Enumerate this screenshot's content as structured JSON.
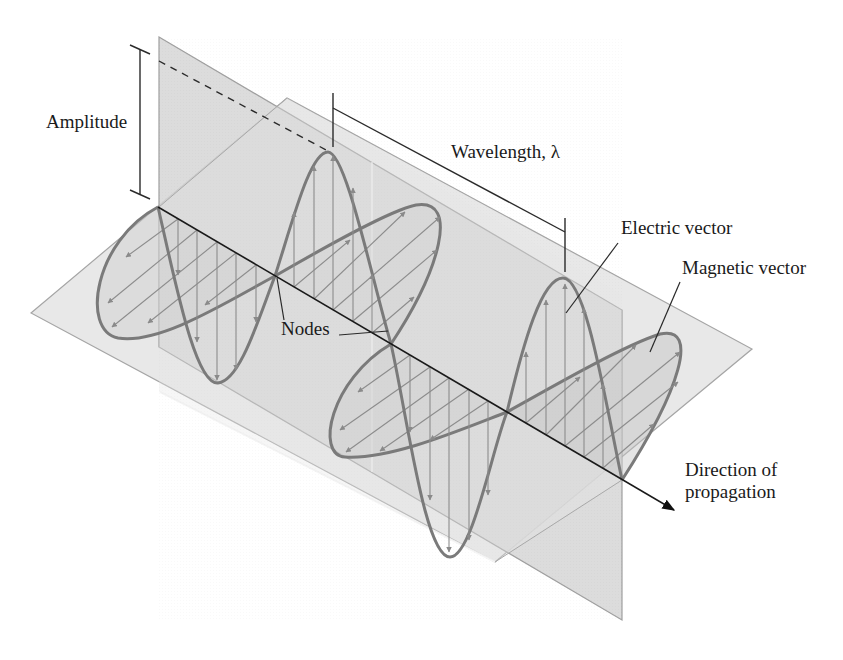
{
  "figure": {
    "labels": {
      "amplitude": "Amplitude",
      "wavelength": "Wavelength, λ",
      "electric_vector": "Electric vector",
      "magnetic_vector": "Magnetic vector",
      "nodes": "Nodes",
      "direction_line1": "Direction of",
      "direction_line2": "propagation"
    },
    "colors": {
      "background": "#ffffff",
      "vertical_plane_fill": "#d6d6d6",
      "horizontal_plane_fill": "#e6e6e6",
      "plane_edge": "#9a9a9a",
      "wave_curve": "#7a7a7a",
      "vector_arrows": "#8c8c8c",
      "axis": "#1a1a1a",
      "dimension_lines": "#2a2a2a"
    },
    "elements": [
      "vertical-plane (electric field plane)",
      "horizontal-plane (magnetic field plane)",
      "electric-wave with vertical vector arrows",
      "magnetic-wave with diagonal vector arrows",
      "propagation-axis arrow",
      "amplitude dimension bracket",
      "wavelength dimension bracket",
      "two node callouts"
    ]
  }
}
